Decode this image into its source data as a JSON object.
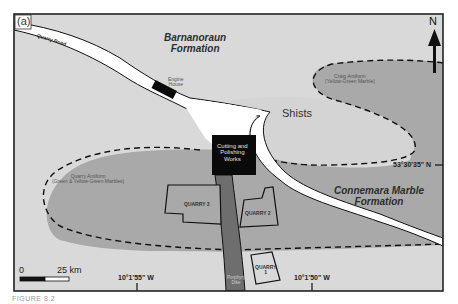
{
  "figure": {
    "panel_label": "(a)",
    "caption_fragment": "FIGURE 8.2"
  },
  "colors": {
    "barnanoraun_fill": "#d9d9d9",
    "marble_fill": "#a9a9a9",
    "shists_fill": "#d4d4d4",
    "road_fill": "#ffffff",
    "dike_fill": "#6e6e6e",
    "building_fill": "#0a0a0a",
    "frame": "#222222"
  },
  "map": {
    "road_label": "Quarry Road",
    "formations": {
      "north": [
        "Barnanoraun",
        "Formation"
      ],
      "south": [
        "Connemara Marble",
        "Formation"
      ]
    },
    "shists_label": "Shists",
    "craig_antiform": [
      "Craig Antiform",
      "(Yellow-Green Marble)"
    ],
    "quarry_antiform": [
      "Quarry Antiform",
      "(Green & Yellow-Green Marbles)"
    ],
    "engine_house": [
      "Engine",
      "House"
    ],
    "cutting_works": [
      "Cutting and",
      "Polishing",
      "Works"
    ],
    "porphyry_dike": [
      "Porphyry",
      "Dike"
    ],
    "quarries": {
      "q1": [
        "QUARRY",
        "1"
      ],
      "q2": "QUARRY 2",
      "q3": "QUARRY 3"
    },
    "north_arrow": "N",
    "coordinates": {
      "latitude": "53°30'35\" N",
      "longitude_west": "10°1'55\" W",
      "longitude_east": "10°1'50\" W"
    },
    "scale_bar": {
      "start": "0",
      "end": "25 km"
    }
  }
}
